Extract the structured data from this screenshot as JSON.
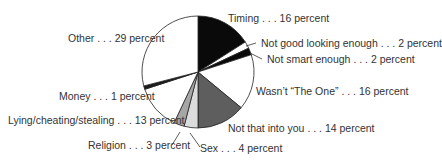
{
  "chart_data": {
    "type": "pie",
    "title": "",
    "start_angle_deg": 0,
    "direction": "clockwise",
    "slices": [
      {
        "label": "Timing",
        "value": 16,
        "text": "Timing . . . 16 percent",
        "color": "#0a0a0a"
      },
      {
        "label": "Not good looking enough",
        "value": 2,
        "text": "Not good looking enough . . . 2 percent",
        "color": "#ffffff"
      },
      {
        "label": "Not smart enough",
        "value": 2,
        "text": "Not smart enough . . . 2 percent",
        "color": "#0a0a0a"
      },
      {
        "label": "Wasn't “The One”",
        "value": 16,
        "text": "Wasn’t “The One” . . . 16 percent",
        "color": "#ffffff"
      },
      {
        "label": "Not that into you",
        "value": 14,
        "text": "Not that into you . . . 14 percent",
        "color": "#5e5e5e"
      },
      {
        "label": "Sex",
        "value": 4,
        "text": "Sex . . . 4 percent",
        "color": "#dcdcdc"
      },
      {
        "label": "Religion",
        "value": 3,
        "text": "Religion . . . 3 percent",
        "color": "#a6a6a6"
      },
      {
        "label": "Lying/cheating/stealing",
        "value": 13,
        "text": "Lying/cheating/stealing . . . 13 percent",
        "color": "#ffffff"
      },
      {
        "label": "Money",
        "value": 1,
        "text": "Money . . . 1 percent",
        "color": "#1a1a1a"
      },
      {
        "label": "Other",
        "value": 29,
        "text": "Other . . . 29 percent",
        "color": "#ffffff"
      }
    ],
    "legend": "none (inline callout labels)",
    "grid": false
  },
  "geometry": {
    "cx": 198,
    "cy": 72,
    "r": 56
  }
}
